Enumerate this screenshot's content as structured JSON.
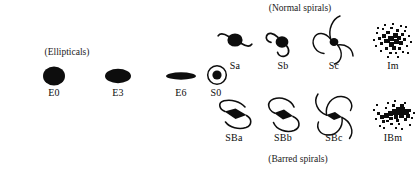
{
  "diagram": {
    "ink_color": "#0d0d0d",
    "background_color": "#ffffff",
    "group_labels": {
      "ellipticals": "(Ellipticals)",
      "normal_spirals": "(Normal spirals)",
      "barred_spirals": "(Barred spirals)"
    },
    "sequences": [
      {
        "name": "elliptical-lenticular-sequence",
        "items": [
          {
            "label": "E0",
            "icon": "filled-round-ellipse-icon"
          },
          {
            "label": "E3",
            "icon": "filled-oval-ellipse-icon"
          },
          {
            "label": "E6",
            "icon": "filled-flat-ellipse-icon"
          },
          {
            "label": "S0",
            "icon": "lenticular-ring-icon"
          }
        ]
      },
      {
        "name": "normal-spiral-sequence",
        "items": [
          {
            "label": "Sa",
            "icon": "spiral-tight-icon"
          },
          {
            "label": "Sb",
            "icon": "spiral-medium-icon"
          },
          {
            "label": "Sc",
            "icon": "spiral-open-icon"
          },
          {
            "label": "Im",
            "icon": "irregular-cloud-icon"
          }
        ]
      },
      {
        "name": "barred-spiral-sequence",
        "items": [
          {
            "label": "SBa",
            "icon": "barred-spiral-tight-icon"
          },
          {
            "label": "SBb",
            "icon": "barred-spiral-medium-icon"
          },
          {
            "label": "SBc",
            "icon": "barred-spiral-open-icon"
          },
          {
            "label": "IBm",
            "icon": "irregular-barred-cloud-icon"
          }
        ]
      }
    ]
  }
}
